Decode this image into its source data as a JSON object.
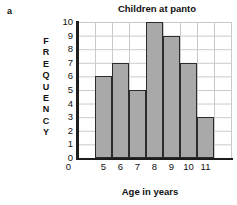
{
  "part_label": "a",
  "chart_data": {
    "type": "bar",
    "title": "Children at panto",
    "xlabel": "Age in years",
    "ylabel": "FREQUENCY",
    "categories": [
      "5",
      "6",
      "7",
      "8",
      "9",
      "10",
      "11"
    ],
    "values": [
      6,
      7,
      5,
      10,
      9,
      7,
      3
    ],
    "x_tick_labels": [
      "5",
      "6",
      "7",
      "8",
      "9",
      "10",
      "11"
    ],
    "x_origin_label": "0",
    "y_tick_labels": [
      "10",
      "9",
      "8",
      "7",
      "6",
      "5",
      "4",
      "3",
      "2",
      "1",
      "0"
    ],
    "ylim": [
      0,
      10
    ],
    "grid": true,
    "legend": "none",
    "bar_fill": "#a9a9a9",
    "bar_edge": "#2b2b2b",
    "grid_color": "#c9c9c9",
    "axis_color": "#1d1d1d"
  }
}
